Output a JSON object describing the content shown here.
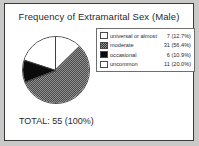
{
  "chart_data": {
    "type": "pie",
    "title": "Frequency of Extramarital Sex (Male)",
    "categories": [
      "universal or almost",
      "moderate",
      "occasional",
      "uncommon"
    ],
    "values": [
      7,
      31,
      6,
      11
    ],
    "percents": [
      12.7,
      56.4,
      10.9,
      20.0
    ],
    "value_labels": [
      "7 (12.7%)",
      "31 (56.4%)",
      "6 (10.9%)",
      "11 (20.0%)"
    ],
    "patterns": [
      "white",
      "checkered-gray",
      "solid-black",
      "light-dither"
    ],
    "start_angle_deg": 0,
    "direction": "clockwise",
    "legend_position": "right",
    "total": 55,
    "total_percent": "100%",
    "total_label": "TOTAL: 55 (100%)"
  },
  "legend": {
    "rows": [
      {
        "label": "universal or almost",
        "value": "7 (12.7%)",
        "swatch": "white"
      },
      {
        "label": "moderate",
        "value": "31 (56.4%)",
        "swatch": "mod"
      },
      {
        "label": "occasional",
        "value": "6 (10.9%)",
        "swatch": "black"
      },
      {
        "label": "uncommon",
        "value": "11 (20.0%)",
        "swatch": "light"
      }
    ]
  },
  "colors": {
    "page_background": "#c9c9c7",
    "frame_background": "#ffffff",
    "frame_border": "#3b3b3b",
    "text": "#2a2a2a",
    "black_slice": "#0b0b0b",
    "gray_slice": "#8f8f8f"
  }
}
